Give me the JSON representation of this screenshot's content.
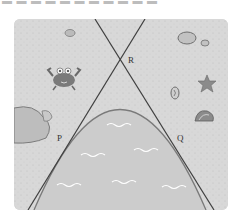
{
  "header": {
    "cropped_text": "▬ ▬ ▬ ▬ ▬ ▬ ▬ ▬ ▬ ▬ ▬"
  },
  "diagram": {
    "points": {
      "R": "R",
      "P": "P",
      "Q": "Q"
    },
    "colors": {
      "sand": "#d9d9d9",
      "water": "#cfcfcf",
      "line": "#444444",
      "curve": "#777777",
      "wave": "#ffffff",
      "object": "#8a8a8a"
    },
    "decorations": [
      "crab",
      "rock-left",
      "small-pebble-top",
      "rock-top-right",
      "pebble-top-right",
      "starfish",
      "shell-1",
      "shell-2"
    ]
  }
}
